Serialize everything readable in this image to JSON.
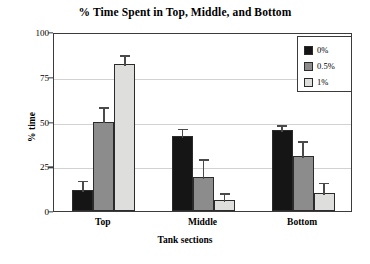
{
  "chart_data": {
    "type": "bar",
    "title": "% Time Spent in Top, Middle, and Bottom",
    "xlabel": "Tank sections",
    "ylabel": "% time",
    "categories": [
      "Top",
      "Middle",
      "Bottom"
    ],
    "ylim": [
      0,
      100
    ],
    "yticks": [
      0,
      25,
      50,
      75,
      100
    ],
    "ytick_labels": [
      "0",
      "25",
      "50",
      "75",
      "100"
    ],
    "grid": true,
    "legend_position": "top-right",
    "series": [
      {
        "name": "0%",
        "color": "#151515",
        "values": [
          12,
          42,
          45
        ],
        "errors": [
          6,
          5,
          4
        ]
      },
      {
        "name": "0.5%",
        "color": "#8c8c8c",
        "values": [
          50,
          19,
          31
        ],
        "errors": [
          9,
          11,
          9
        ]
      },
      {
        "name": "1%",
        "color": "#dededc",
        "values": [
          82,
          6,
          10
        ],
        "errors": [
          6,
          5,
          7
        ]
      }
    ]
  },
  "legend": {
    "items": [
      {
        "label": "0%",
        "color": "#151515"
      },
      {
        "label": "0.5%",
        "color": "#8c8c8c"
      },
      {
        "label": "1%",
        "color": "#dededc"
      }
    ]
  }
}
